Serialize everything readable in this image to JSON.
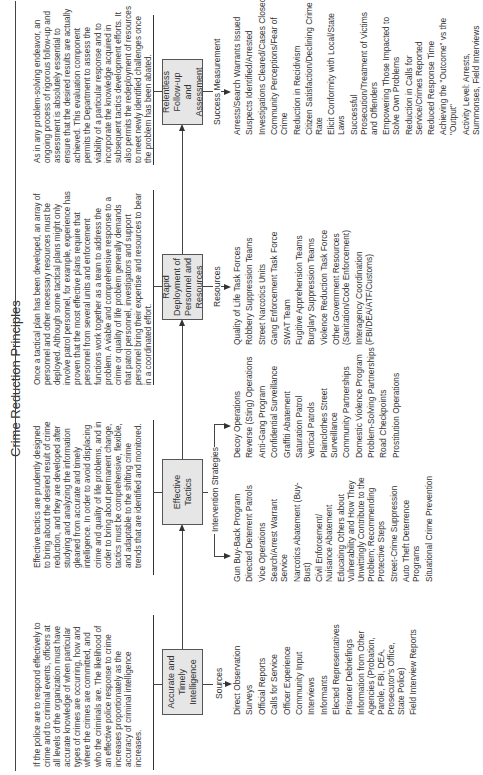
{
  "title": "Crime Reduction Principles",
  "columns": [
    {
      "box": "Accurate and Timely Intelligence",
      "description": "If the police are to respond effectively to crime and to criminal events, officers at all levels of the organization must have accurate knowledge of when particular types of crimes are occurring, how and where the crimes are committed, and who the criminals are. The likelihood of an effective police response to crime increases proportionately as the accuracy of criminal intelligence increases.",
      "list_label": "Sources",
      "items": [
        "Direct Observation",
        "Surveys",
        "Official Reports",
        "Calls for Service",
        "Officer Experience",
        "Community Input",
        "Interviews",
        "Informants",
        "Elected Representatives",
        "Prisoner Debriefings",
        "Information from Other Agencies (Probation, Parole, FBI, DEA, Prosecutor's Office, State Police)",
        "Field Interview Reports"
      ]
    },
    {
      "box": "Effective Tactics",
      "description": "Effective tactics are prudently designed to bring about the desired result of crime reduction, and they are developed after studying and analyzing the information gleaned from accurate and timely intelligence. In order to avoid displacing crime and quality of life problems, and in order to bring about permanent change, tactics must be comprehensive, flexible, and adaptable to the shifting crime trends that are identified and monitored.",
      "list_label": "Intervention Strategies",
      "items_left": [
        "Gun Buy-Back Program",
        "Directed Deterrent Patrols",
        "Vice Operations",
        "Search/Arrest Warrant Service",
        "Narcotics Abatement (Buy-Bust)",
        "Civil Enforcement/ Nuisance Abatement",
        "Educating Others about Vulnerability and How They Unwittingly Contribute to the Problem; Recommending Protective Steps",
        "Street-Crime Suppression",
        "Auto Theft Deterrence Programs",
        "Situational Crime Prevention"
      ],
      "items_right": [
        "Decoy Operations",
        "Reverse (Sting) Operations",
        "Anti-Gang Program",
        "Confidential Surveillance",
        "Graffiti Abatement",
        "Saturation Patrol",
        "Vertical Patrols",
        "Plainclothes Street Surveillance",
        "Community Partnerships",
        "Domestic Violence Program",
        "Problem-Solving Partnerships",
        "Road Checkpoints",
        "Prostitution Operations"
      ]
    },
    {
      "box": "Rapid Deployment of Personnel and Resources",
      "description": "Once a tactical plan has been developed, an array of personnel and other necessary resources must be deployed. Although some tactical plans might only involve patrol personnel, for example, experience has proven that the most effective plans require that personnel from several units and enforcement functions work together as a team to address the problem. A viable and comprehensive response to a crime or quality of life problem generally demands that patrol personnel, investigators and support personnel bring their expertise and resources to bear in a coordinated effort.",
      "list_label": "Resources",
      "items": [
        "Quality of Life Task Forces",
        "Robbery Suppression Teams",
        "Street Narcotics Units",
        "Gang Enforcement Task Force",
        "SWAT Team",
        "Fugitive Apprehension Teams",
        "Burglary Suppression Teams",
        "Violence Reduction Task Force",
        "Other Government Resources (Sanitation/Code Enforcement)",
        "Interagency Coordination (FBI/DEA/ATF/Customs)"
      ]
    },
    {
      "box": "Relentless Follow-up and Assessment",
      "description": "As in any problem-solving endeavor, an ongoing process of rigorous follow-up and assessment is absolutely essential to ensure that the desired results are actually achieved. This evaluation component permits the Department to assess the viability of a particular response and to incorporate the knowledge acquired in subsequent tactics development efforts. It also permits the redeployment of resources to meet newly identified challenges once the problem has been abated.",
      "list_label": "Success Measurement",
      "items": [
        "Arrests/Search Warrants Issued",
        "Suspects Identified/Arrested",
        "Investigations Cleared/Cases Closed",
        "Community Perceptions/Fear of Crime",
        "Reduction in Recidivism",
        "Citizen Satisfaction/Declining Crime Rate",
        "Elicit Conformity with Local/State Laws",
        "Successful Prosecution/Treatment of Victims and Offenders",
        "Empowering Those Impacted to Solve Own Problems",
        "Reduction in Calls for Service/Crimes Reported",
        "Reduced Response Time",
        "Achieving the \"Outcome\" vs the \"Output\"",
        "Activity Level: Arrests, Summonses, Field Interviews"
      ]
    }
  ],
  "colors": {
    "box_fill": "#e6e6e6",
    "line": "#444444",
    "text": "#333333"
  }
}
